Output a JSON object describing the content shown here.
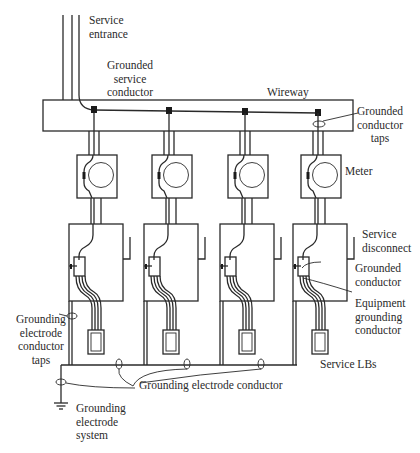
{
  "diagram": {
    "type": "electrical-schematic",
    "units_count": 4,
    "colors": {
      "line": "#2a2a2a",
      "terminal": "#1a1a1a",
      "background": "#ffffff"
    }
  },
  "labels": {
    "service_entrance": "Service\nentrance",
    "grounded_service_conductor": "Grounded\nservice\nconductor",
    "wireway": "Wireway",
    "grounded_conductor_taps": "Grounded\nconductor\ntaps",
    "meter": "Meter",
    "service_disconnect": "Service\ndisconnect",
    "grounded_conductor": "Grounded\nconductor",
    "equipment_grounding_conductor": "Equipment\ngrounding\nconductor",
    "service_lbs": "Service LBs",
    "grounding_electrode_conductor_taps": "Grounding\nelectrode\nconductor\ntaps",
    "grounding_electrode_conductor": "Grounding electrode conductor",
    "grounding_electrode_system": "Grounding\nelectrode\nsystem"
  },
  "units": [
    {
      "id": 1,
      "meter": "meter-1",
      "disconnect": "disconnect-1",
      "lb": "lb-1"
    },
    {
      "id": 2,
      "meter": "meter-2",
      "disconnect": "disconnect-2",
      "lb": "lb-2"
    },
    {
      "id": 3,
      "meter": "meter-3",
      "disconnect": "disconnect-3",
      "lb": "lb-3"
    },
    {
      "id": 4,
      "meter": "meter-4",
      "disconnect": "disconnect-4",
      "lb": "lb-4"
    }
  ]
}
